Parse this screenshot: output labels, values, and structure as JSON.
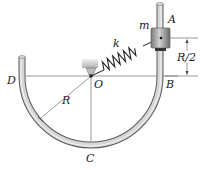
{
  "diagram": {
    "labels": {
      "A": "A",
      "B": "B",
      "C": "C",
      "D": "D",
      "O": "O",
      "R": "R",
      "R_half": "R/2",
      "k": "k",
      "m": "m"
    },
    "colors": {
      "tube": "#c9c9c9",
      "tube_edge": "#6a6a6a",
      "line": "#444444",
      "collar": "#9a9a9a",
      "spring": "#222222",
      "support": "#d8d8d8"
    }
  }
}
